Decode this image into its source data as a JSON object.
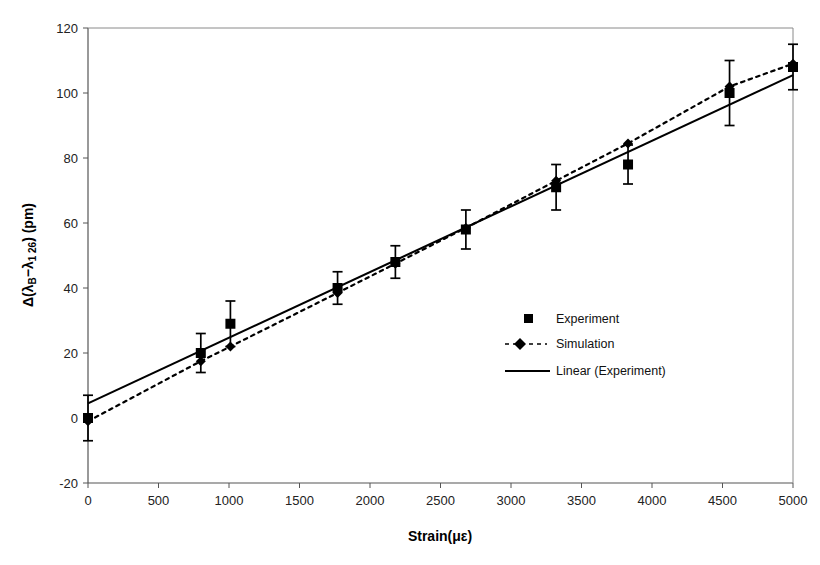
{
  "chart_data": {
    "type": "scatter",
    "title": "",
    "xlabel": "Strain(με)",
    "ylabel": "Δ(λB−λ1 26) (pm)",
    "ylabel_parts": {
      "delta": "Δ(",
      "lambda_b": "λ",
      "sub_b": "B",
      "minus": "−",
      "lambda_1": "λ",
      "sub_1": "1 26",
      "close": ") (pm)"
    },
    "xlim": [
      0,
      5000
    ],
    "ylim": [
      -20,
      120
    ],
    "xticks": [
      0,
      500,
      1000,
      1500,
      2000,
      2500,
      3000,
      3500,
      4000,
      4500,
      5000
    ],
    "yticks": [
      -20,
      0,
      20,
      40,
      60,
      80,
      100,
      120
    ],
    "xtick_labels": [
      "0",
      "500",
      "1000",
      "1500",
      "2000",
      "2500",
      "3000",
      "3500",
      "4000",
      "4500",
      "5000"
    ],
    "ytick_labels": [
      "-20",
      "0",
      "20",
      "40",
      "60",
      "80",
      "100",
      "120"
    ],
    "grid": false,
    "legend_position": "center-right",
    "series": [
      {
        "name": "Experiment",
        "marker": "square",
        "line": "none",
        "color": "#000000",
        "x": [
          0,
          800,
          1010,
          1770,
          2180,
          2680,
          3320,
          3830,
          4550,
          5000
        ],
        "y": [
          0,
          20,
          29,
          40,
          48,
          58,
          71,
          78,
          100,
          108
        ],
        "yerr": [
          7,
          6,
          7,
          5,
          5,
          6,
          7,
          6,
          10,
          7
        ]
      },
      {
        "name": "Simulation",
        "marker": "diamond",
        "line": "dashed",
        "color": "#000000",
        "x": [
          0,
          800,
          1010,
          1770,
          2180,
          2680,
          3320,
          3830,
          4550,
          5000
        ],
        "y": [
          -1,
          17.5,
          22,
          38.5,
          47.5,
          58.5,
          73,
          84.5,
          102,
          109
        ]
      },
      {
        "name": "Linear (Experiment)",
        "marker": "none",
        "line": "solid",
        "color": "#000000",
        "fit": {
          "x0": 0,
          "y0": 4.5,
          "x1": 5000,
          "y1": 105.5
        }
      }
    ],
    "legend": [
      {
        "label": "Experiment",
        "glyph": "square-marker"
      },
      {
        "label": "Simulation",
        "glyph": "dashed-line-with-diamond"
      },
      {
        "label": "Linear (Experiment)",
        "glyph": "solid-line"
      }
    ]
  }
}
